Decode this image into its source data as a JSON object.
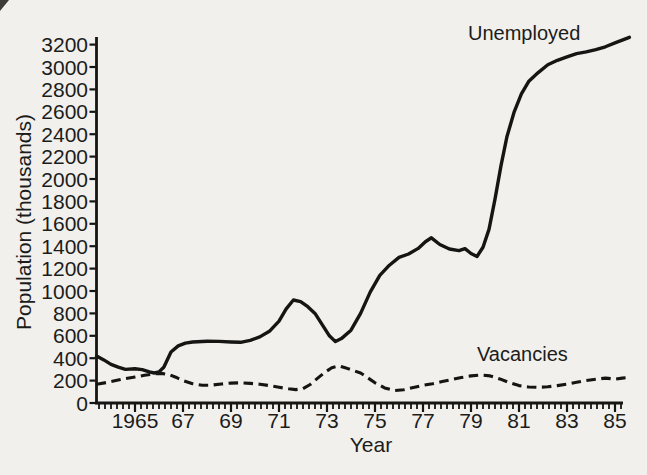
{
  "figure": {
    "background_color": "#f1f0ed",
    "ink_color": "#151513",
    "scan_artifact": "dark-corner-smudge-top-left"
  },
  "chart_data": {
    "type": "line",
    "title": "",
    "xlabel": "Year",
    "ylabel": "Population (thousands)",
    "xlim": [
      1963.3,
      1985.7
    ],
    "ylim": [
      0,
      3300
    ],
    "grid": false,
    "legend": "inline-annotations",
    "x_tick_years": [
      1965,
      1967,
      1969,
      1971,
      1973,
      1975,
      1977,
      1979,
      1981,
      1983,
      1985
    ],
    "x_tick_labels": [
      "1965",
      "67",
      "69",
      "71",
      "73",
      "75",
      "77",
      "79",
      "81",
      "83",
      "85"
    ],
    "x_minor_tick_interval_years": 0.25,
    "y_ticks": [
      0,
      200,
      400,
      600,
      800,
      1000,
      1200,
      1400,
      1600,
      1800,
      2000,
      2200,
      2400,
      2600,
      2800,
      3000,
      3200
    ],
    "y_tick_labels": [
      "0",
      "200",
      "400",
      "600",
      "800",
      "1000",
      "1200",
      "1400",
      "1600",
      "1800",
      "2000",
      "2200",
      "2400",
      "2600",
      "2800",
      "3000",
      "3200"
    ],
    "series": [
      {
        "name": "Unemployed",
        "style": "solid",
        "x": [
          1963.4,
          1963.7,
          1964.0,
          1964.3,
          1964.6,
          1965.0,
          1965.3,
          1965.6,
          1965.8,
          1966.0,
          1966.2,
          1966.5,
          1966.8,
          1967.1,
          1967.4,
          1968.0,
          1968.5,
          1969.0,
          1969.4,
          1969.8,
          1970.2,
          1970.6,
          1971.0,
          1971.3,
          1971.6,
          1971.9,
          1972.2,
          1972.5,
          1972.8,
          1973.1,
          1973.35,
          1973.6,
          1974.0,
          1974.4,
          1974.8,
          1975.2,
          1975.6,
          1976.0,
          1976.4,
          1976.8,
          1977.1,
          1977.35,
          1977.7,
          1978.1,
          1978.5,
          1978.75,
          1979.0,
          1979.25,
          1979.5,
          1979.75,
          1980.0,
          1980.25,
          1980.5,
          1980.8,
          1981.1,
          1981.4,
          1981.8,
          1982.2,
          1982.6,
          1983.0,
          1983.4,
          1983.8,
          1984.2,
          1984.6,
          1985.0,
          1985.3,
          1985.6
        ],
        "values": [
          420,
          385,
          345,
          320,
          300,
          305,
          298,
          278,
          268,
          278,
          320,
          455,
          510,
          535,
          545,
          552,
          550,
          545,
          542,
          560,
          590,
          640,
          730,
          840,
          920,
          905,
          860,
          800,
          700,
          600,
          548,
          575,
          650,
          800,
          990,
          1140,
          1230,
          1300,
          1330,
          1380,
          1440,
          1475,
          1415,
          1375,
          1360,
          1378,
          1335,
          1308,
          1390,
          1550,
          1820,
          2120,
          2380,
          2600,
          2760,
          2870,
          2950,
          3020,
          3060,
          3090,
          3120,
          3135,
          3155,
          3180,
          3215,
          3240,
          3265
        ]
      },
      {
        "name": "Vacancies",
        "style": "dashed",
        "x": [
          1963.4,
          1963.8,
          1964.2,
          1964.6,
          1965.0,
          1965.4,
          1965.8,
          1966.1,
          1966.4,
          1966.7,
          1967.0,
          1967.4,
          1967.8,
          1968.2,
          1968.6,
          1969.0,
          1969.4,
          1969.8,
          1970.2,
          1970.6,
          1971.0,
          1971.4,
          1971.7,
          1972.0,
          1972.3,
          1972.6,
          1972.9,
          1973.2,
          1973.5,
          1973.8,
          1974.1,
          1974.4,
          1974.7,
          1975.0,
          1975.4,
          1975.8,
          1976.2,
          1976.6,
          1977.0,
          1977.4,
          1977.8,
          1978.2,
          1978.6,
          1979.0,
          1979.4,
          1979.8,
          1980.2,
          1980.6,
          1981.0,
          1981.4,
          1981.8,
          1982.2,
          1982.6,
          1983.0,
          1983.4,
          1983.8,
          1984.2,
          1984.6,
          1985.0,
          1985.3,
          1985.6
        ],
        "values": [
          168,
          182,
          200,
          218,
          232,
          248,
          260,
          264,
          255,
          230,
          200,
          172,
          158,
          160,
          170,
          178,
          180,
          175,
          168,
          155,
          140,
          127,
          120,
          128,
          165,
          220,
          272,
          315,
          330,
          312,
          290,
          268,
          225,
          180,
          135,
          112,
          118,
          138,
          158,
          172,
          192,
          210,
          228,
          242,
          250,
          242,
          215,
          182,
          155,
          143,
          140,
          145,
          155,
          168,
          185,
          200,
          212,
          222,
          213,
          222,
          228
        ]
      }
    ],
    "annotations": [
      {
        "text": "Unemployed",
        "series": "Unemployed"
      },
      {
        "text": "Vacancies",
        "series": "Vacancies"
      }
    ]
  }
}
